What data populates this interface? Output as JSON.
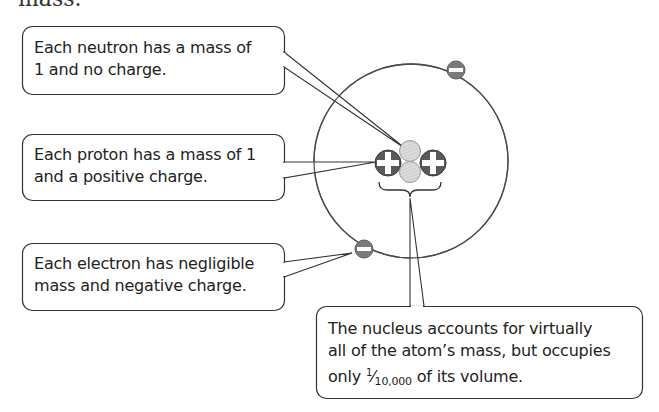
{
  "top_text": "mass.",
  "diagram": {
    "colors": {
      "outline": "#4a4a4a",
      "proton": "#5a5a5a",
      "neutron": "#d8d8d8",
      "electron": "#7a7a7a",
      "background": "#ffffff"
    },
    "particles": {
      "protons": 2,
      "neutrons": 2,
      "electrons": 2
    }
  },
  "callouts": {
    "neutron": {
      "lines": [
        "Each neutron has a mass of",
        "1 and no charge."
      ]
    },
    "proton": {
      "lines": [
        "Each proton has a mass of 1",
        "and a positive charge."
      ]
    },
    "electron": {
      "lines": [
        "Each electron has negligible",
        "mass and negative charge."
      ]
    },
    "nucleus": {
      "lines": [
        "The nucleus accounts for virtually",
        "all of the atom’s mass, but occupies"
      ],
      "line3_prefix": "only ",
      "fraction_numerator": "1",
      "fraction_denominator": "10,000",
      "line3_suffix": " of its volume."
    }
  }
}
